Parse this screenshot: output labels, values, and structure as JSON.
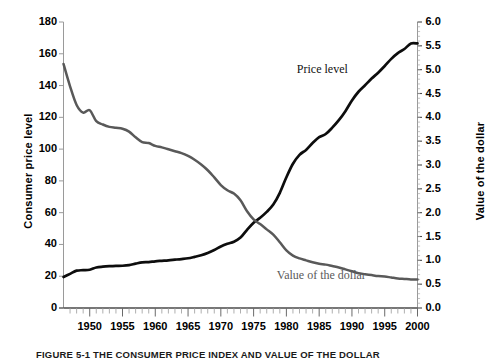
{
  "figure": {
    "caption": "FIGURE 5-1   THE CONSUMER PRICE INDEX AND VALUE OF THE DOLLAR"
  },
  "chart_data": {
    "type": "line",
    "title": "",
    "xlabel": "",
    "ylabel": "Consumer price level",
    "y2label": "Value of the dollar",
    "xlim": [
      1946,
      2000
    ],
    "ylim": [
      0,
      180
    ],
    "y2lim": [
      0.0,
      6.0
    ],
    "grid": false,
    "legend_position": "inline-annotation",
    "xticks": [
      "1950",
      "1955",
      "1960",
      "1965",
      "1970",
      "1975",
      "1980",
      "1985",
      "1990",
      "1995",
      "2000"
    ],
    "xtick_values": [
      1950,
      1955,
      1960,
      1965,
      1970,
      1975,
      1980,
      1985,
      1990,
      1995,
      2000
    ],
    "xminor_step": 1,
    "yticks": [
      "0",
      "20",
      "40",
      "60",
      "80",
      "100",
      "120",
      "140",
      "160",
      "180"
    ],
    "ytick_values": [
      0,
      20,
      40,
      60,
      80,
      100,
      120,
      140,
      160,
      180
    ],
    "y2ticks": [
      "0.0",
      "0.5",
      "1.0",
      "1.5",
      "2.0",
      "2.5",
      "3.0",
      "3.5",
      "4.0",
      "4.5",
      "5.0",
      "5.5",
      "6.0"
    ],
    "y2tick_values": [
      0.0,
      0.5,
      1.0,
      1.5,
      2.0,
      2.5,
      3.0,
      3.5,
      4.0,
      4.5,
      5.0,
      5.5,
      6.0
    ],
    "annotations": [
      {
        "name": "price-level",
        "text": "Price level",
        "x": 1988,
        "y": 150,
        "color": "#111111"
      },
      {
        "name": "dollar-value",
        "text": "Value of the dollar",
        "x": 1988,
        "y": 20,
        "color": "#5a5a5a"
      }
    ],
    "series": [
      {
        "name": "Price level",
        "axis": "left",
        "color": "#0d0d0d",
        "x": [
          1946,
          1947,
          1948,
          1949,
          1950,
          1951,
          1952,
          1953,
          1954,
          1955,
          1956,
          1957,
          1958,
          1959,
          1960,
          1961,
          1962,
          1963,
          1964,
          1965,
          1966,
          1967,
          1968,
          1969,
          1970,
          1971,
          1972,
          1973,
          1974,
          1975,
          1976,
          1977,
          1978,
          1979,
          1980,
          1981,
          1982,
          1983,
          1984,
          1985,
          1986,
          1987,
          1988,
          1989,
          1990,
          1991,
          1992,
          1993,
          1994,
          1995,
          1996,
          1997,
          1998,
          1999,
          2000
        ],
        "values": [
          19.5,
          21.5,
          23.5,
          23.8,
          24.1,
          25.5,
          26.0,
          26.3,
          26.5,
          26.6,
          27.0,
          27.9,
          28.7,
          28.9,
          29.4,
          29.7,
          30.0,
          30.4,
          30.8,
          31.3,
          32.2,
          33.2,
          34.6,
          36.5,
          38.7,
          40.4,
          41.7,
          44.3,
          49.2,
          53.7,
          56.8,
          60.5,
          65.1,
          72.5,
          82.3,
          90.8,
          96.4,
          99.5,
          103.8,
          107.5,
          109.5,
          113.5,
          118.2,
          123.9,
          130.6,
          136.1,
          140.2,
          144.4,
          148.1,
          152.3,
          156.8,
          160.4,
          163.0,
          166.5,
          166.5
        ]
      },
      {
        "name": "Value of the dollar",
        "axis": "right",
        "color": "#595959",
        "x": [
          1946,
          1947,
          1948,
          1949,
          1950,
          1951,
          1952,
          1953,
          1954,
          1955,
          1956,
          1957,
          1958,
          1959,
          1960,
          1961,
          1962,
          1963,
          1964,
          1965,
          1966,
          1967,
          1968,
          1969,
          1970,
          1971,
          1972,
          1973,
          1974,
          1975,
          1976,
          1977,
          1978,
          1979,
          1980,
          1981,
          1982,
          1983,
          1984,
          1985,
          1986,
          1987,
          1988,
          1989,
          1990,
          1991,
          1992,
          1993,
          1994,
          1995,
          1996,
          1997,
          1998,
          1999,
          2000
        ],
        "values": [
          5.12,
          4.65,
          4.26,
          4.1,
          4.15,
          3.92,
          3.85,
          3.8,
          3.78,
          3.76,
          3.7,
          3.58,
          3.48,
          3.46,
          3.4,
          3.37,
          3.33,
          3.29,
          3.25,
          3.19,
          3.11,
          3.01,
          2.89,
          2.74,
          2.58,
          2.47,
          2.4,
          2.26,
          2.03,
          1.86,
          1.76,
          1.65,
          1.54,
          1.38,
          1.21,
          1.1,
          1.04,
          1.0,
          0.96,
          0.93,
          0.91,
          0.88,
          0.85,
          0.81,
          0.77,
          0.73,
          0.71,
          0.69,
          0.67,
          0.66,
          0.64,
          0.62,
          0.61,
          0.6,
          0.6
        ]
      }
    ]
  }
}
